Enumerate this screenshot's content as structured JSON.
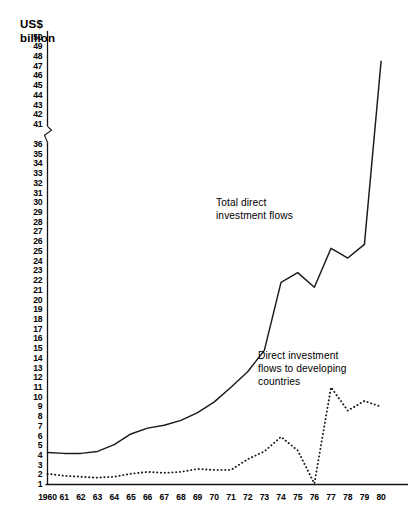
{
  "chart_data": {
    "type": "line",
    "title": "",
    "subtitle": "",
    "xlabel": "",
    "ylabel": "US$\nbillion",
    "ylabel_line1": "US$",
    "ylabel_line2": "billion",
    "x": [
      1960,
      1961,
      1962,
      1963,
      1964,
      1965,
      1966,
      1967,
      1968,
      1969,
      1970,
      1971,
      1972,
      1973,
      1974,
      1975,
      1976,
      1977,
      1978,
      1979,
      1980
    ],
    "xtick_labels": [
      "1960",
      "61",
      "62",
      "63",
      "64",
      "65",
      "66",
      "67",
      "68",
      "69",
      "70",
      "71",
      "72",
      "73",
      "74",
      "75",
      "76",
      "77",
      "78",
      "79",
      "80"
    ],
    "ytick_labels": [
      "50",
      "49",
      "48",
      "47",
      "46",
      "45",
      "44",
      "43",
      "42",
      "41",
      "36",
      "35",
      "34",
      "33",
      "32",
      "31",
      "30",
      "29",
      "28",
      "27",
      "26",
      "25",
      "24",
      "23",
      "22",
      "21",
      "20",
      "19",
      "18",
      "17",
      "16",
      "15",
      "14",
      "13",
      "12",
      "11",
      "10",
      "9",
      "8",
      "7",
      "6",
      "5",
      "4",
      "3",
      "2",
      "1"
    ],
    "ylim": [
      1,
      50
    ],
    "axis_break": {
      "between": [
        36,
        41
      ],
      "present": true
    },
    "grid": false,
    "legend_position": "inline-annotation",
    "series": [
      {
        "name": "Total direct investment flows",
        "style": "solid",
        "color": "#1a1a1a",
        "annotation": "Total direct\ninvestment flows",
        "values": [
          4.3,
          4.2,
          4.2,
          4.4,
          5.1,
          6.2,
          6.8,
          7.1,
          7.6,
          8.4,
          9.5,
          11.0,
          12.6,
          14.8,
          14.3,
          18.4,
          21.9,
          21.2,
          25.0,
          24.2,
          25.6
        ]
      },
      {
        "name": "Direct investment flows to developing countries",
        "style": "dotted",
        "color": "#1a1a1a",
        "annotation": "Direct investment\nflows to developing\ncountries",
        "values": [
          2.1,
          1.9,
          1.8,
          1.7,
          1.8,
          1.9,
          2.1,
          2.3,
          2.4,
          2.2,
          2.2,
          2.1,
          2.3,
          2.6,
          2.5,
          2.5,
          3.6,
          4.4,
          5.9,
          4.5,
          1.1
        ]
      }
    ],
    "series_full": [
      {
        "name": "Total direct investment flows",
        "points": [
          {
            "year": 1960,
            "value": 4.3
          },
          {
            "year": 1961,
            "value": 4.2
          },
          {
            "year": 1962,
            "value": 4.2
          },
          {
            "year": 1963,
            "value": 4.4
          },
          {
            "year": 1964,
            "value": 5.1
          },
          {
            "year": 1965,
            "value": 6.2
          },
          {
            "year": 1966,
            "value": 6.8
          },
          {
            "year": 1967,
            "value": 7.1
          },
          {
            "year": 1968,
            "value": 7.6
          },
          {
            "year": 1969,
            "value": 8.4
          },
          {
            "year": 1970,
            "value": 9.5
          },
          {
            "year": 1971,
            "value": 11.0
          },
          {
            "year": 1972,
            "value": 12.6
          },
          {
            "year": 1973,
            "value": 14.8
          },
          {
            "year": 1974,
            "value": 21.8
          },
          {
            "year": 1975,
            "value": 22.8
          },
          {
            "year": 1976,
            "value": 21.3
          },
          {
            "year": 1977,
            "value": 25.3
          },
          {
            "year": 1978,
            "value": 24.3
          },
          {
            "year": 1979,
            "value": 25.7
          },
          {
            "year": 1980,
            "value": 47.5
          }
        ]
      },
      {
        "name": "Direct investment flows to developing countries",
        "points": [
          {
            "year": 1960,
            "value": 2.1
          },
          {
            "year": 1961,
            "value": 1.9
          },
          {
            "year": 1962,
            "value": 1.8
          },
          {
            "year": 1963,
            "value": 1.7
          },
          {
            "year": 1964,
            "value": 1.8
          },
          {
            "year": 1965,
            "value": 2.1
          },
          {
            "year": 1966,
            "value": 2.3
          },
          {
            "year": 1967,
            "value": 2.2
          },
          {
            "year": 1968,
            "value": 2.3
          },
          {
            "year": 1969,
            "value": 2.6
          },
          {
            "year": 1970,
            "value": 2.5
          },
          {
            "year": 1971,
            "value": 2.5
          },
          {
            "year": 1972,
            "value": 3.6
          },
          {
            "year": 1973,
            "value": 4.4
          },
          {
            "year": 1974,
            "value": 5.9
          },
          {
            "year": 1975,
            "value": 4.5
          },
          {
            "year": 1976,
            "value": 1.1
          },
          {
            "year": 1977,
            "value": 11.0
          },
          {
            "year": 1978,
            "value": 8.6
          },
          {
            "year": 1979,
            "value": 9.6
          },
          {
            "year": 1980,
            "value": 9.0
          }
        ]
      }
    ]
  },
  "axis": {
    "unit_label": "US$\nbillion"
  },
  "annotations": {
    "total": "Total direct\ninvestment flows",
    "developing": "Direct investment\nflows to developing\ncountries"
  }
}
